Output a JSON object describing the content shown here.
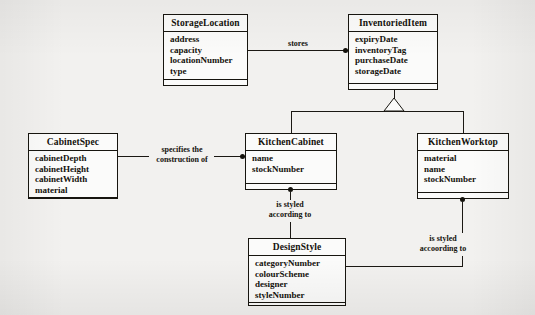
{
  "diagram": {
    "type": "uml-class-diagram",
    "classes": [
      {
        "id": "storage_location",
        "name": "StorageLocation",
        "attributes": [
          "address",
          "capacity",
          "locationNumber",
          "type"
        ]
      },
      {
        "id": "inventoried_item",
        "name": "InventoriedItem",
        "attributes": [
          "expiryDate",
          "inventoryTag",
          "purchaseDate",
          "storageDate"
        ]
      },
      {
        "id": "cabinet_spec",
        "name": "CabinetSpec",
        "attributes": [
          "cabinetDepth",
          "cabinetHeight",
          "cabinetWidth",
          "material"
        ]
      },
      {
        "id": "kitchen_cabinet",
        "name": "KitchenCabinet",
        "attributes": [
          "name",
          "stockNumber"
        ]
      },
      {
        "id": "kitchen_worktop",
        "name": "KitchenWorktop",
        "attributes": [
          "material",
          "name",
          "stockNumber"
        ]
      },
      {
        "id": "design_style",
        "name": "DesignStyle",
        "attributes": [
          "categoryNumber",
          "colourScheme",
          "designer",
          "styleNumber"
        ]
      }
    ],
    "relationships": [
      {
        "id": "stores",
        "label": "stores",
        "from": "storage_location",
        "to": "inventoried_item"
      },
      {
        "id": "specifies",
        "label_line1": "specifies the",
        "label_line2": "construction of",
        "from": "cabinet_spec",
        "to": "kitchen_cabinet"
      },
      {
        "id": "cabinet_style",
        "label_line1": "is styled",
        "label_line2": "according to",
        "from": "kitchen_cabinet",
        "to": "design_style"
      },
      {
        "id": "worktop_style",
        "label_line1": "is styled",
        "label_line2": "accoording to",
        "from": "kitchen_worktop",
        "to": "design_style"
      },
      {
        "id": "generalization",
        "label": "",
        "from": "inventoried_item",
        "to": "kitchen_cabinet, kitchen_worktop"
      }
    ],
    "colors": {
      "background": "#f2f1ef",
      "box_fill": "#fbfbfa",
      "line": "#17150f",
      "text": "#14120c"
    }
  }
}
